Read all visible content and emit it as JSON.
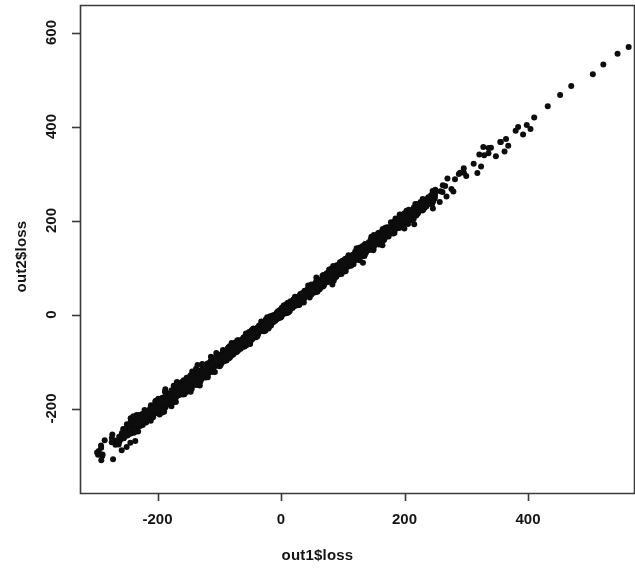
{
  "figure": {
    "background_color": "#ffffff",
    "foreground_color": "#151515",
    "point_color": "#0d0d0d",
    "box_color": "#3a3a3a"
  },
  "chart_data": {
    "type": "scatter",
    "title": "",
    "xlabel": "out1$loss",
    "ylabel": "out2$loss",
    "xlim": [
      -305,
      620
    ],
    "ylim": [
      -325,
      615
    ],
    "xticks": [
      -200,
      0,
      200,
      400
    ],
    "xtick_labels": [
      "-200",
      "0",
      "200",
      "400"
    ],
    "yticks": [
      -200,
      0,
      200,
      400,
      600
    ],
    "ytick_labels": [
      "-200",
      "0",
      "200",
      "400",
      "600"
    ],
    "grid": false,
    "legend": null,
    "marker": "filled-circle",
    "marker_size_px": 6,
    "n_points": 2400,
    "relationship": "near-perfect positive linear, slope 1.0, intercept 0, residual sd grows slightly with |x|",
    "series": [
      {
        "name": "loss",
        "slope": 1.0,
        "intercept": 4,
        "x_center": -20,
        "x_spread": 110,
        "noise_sd": 7,
        "tail_points": [
          [
            -291,
            -309
          ],
          [
            -272,
            -307
          ],
          [
            -258,
            -288
          ],
          [
            -250,
            -281
          ],
          [
            -244,
            -272
          ],
          [
            -236,
            -268
          ],
          [
            410,
            420
          ],
          [
            432,
            444
          ],
          [
            452,
            468
          ],
          [
            470,
            487
          ],
          [
            505,
            512
          ],
          [
            522,
            533
          ],
          [
            545,
            556
          ],
          [
            563,
            570
          ],
          [
            588,
            598
          ]
        ]
      }
    ]
  }
}
